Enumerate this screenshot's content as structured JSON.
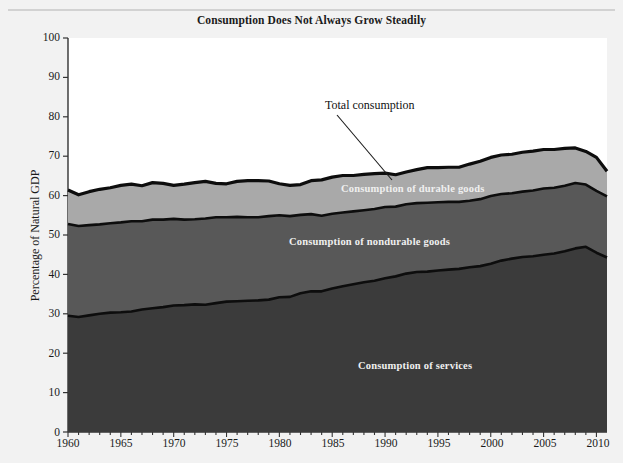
{
  "figure": {
    "title": "Consumption Does Not Always Grow Steadily",
    "caption": "",
    "background_color": "#f2f2f2",
    "plot_background_color": "#ffffff"
  },
  "annotations": {
    "total_consumption": "Total consumption",
    "durable_goods": "Consumption of durable goods",
    "nondurable_goods": "Consumption of nondurable goods",
    "services": "Consumption of services"
  },
  "axis": {
    "ylabel": "Percentage of Natural GDP",
    "yticks": [
      "100",
      "90",
      "80",
      "70",
      "60",
      "50",
      "40",
      "30",
      "20",
      "10",
      "0"
    ],
    "xticks": [
      "1960",
      "1965",
      "1970",
      "1975",
      "1980",
      "1985",
      "1990",
      "1995",
      "2000",
      "2005",
      "2010"
    ]
  },
  "chart_data": {
    "type": "area",
    "title": "Consumption Does Not Always Grow Steadily",
    "xlabel": "",
    "ylabel": "Percentage of Natural GDP",
    "xlim": [
      1960,
      2011
    ],
    "ylim": [
      0,
      100
    ],
    "grid": false,
    "legend": "in-plot labels",
    "stacked": true,
    "colors": {
      "services": "#3b3b3b",
      "nondurable_goods": "#585858",
      "durable_goods": "#a9a9a9",
      "outline": "#101010",
      "plot_background": "#ffffff"
    },
    "x": [
      1960,
      1961,
      1962,
      1963,
      1964,
      1965,
      1966,
      1967,
      1968,
      1969,
      1970,
      1971,
      1972,
      1973,
      1974,
      1975,
      1976,
      1977,
      1978,
      1979,
      1980,
      1981,
      1982,
      1983,
      1984,
      1985,
      1986,
      1987,
      1988,
      1989,
      1990,
      1991,
      1992,
      1993,
      1994,
      1995,
      1996,
      1997,
      1998,
      1999,
      2000,
      2001,
      2002,
      2003,
      2004,
      2005,
      2006,
      2007,
      2008,
      2009,
      2010,
      2011
    ],
    "series": [
      {
        "name": "Consumption of services",
        "values": [
          29.5,
          29.2,
          29.6,
          30.0,
          30.3,
          30.4,
          30.6,
          31.1,
          31.4,
          31.7,
          32.1,
          32.2,
          32.4,
          32.3,
          32.7,
          33.1,
          33.2,
          33.3,
          33.4,
          33.6,
          34.2,
          34.3,
          35.2,
          35.7,
          35.7,
          36.4,
          37.0,
          37.5,
          38.0,
          38.4,
          39.0,
          39.5,
          40.2,
          40.6,
          40.7,
          41.0,
          41.2,
          41.4,
          41.8,
          42.1,
          42.7,
          43.5,
          44.0,
          44.4,
          44.6,
          45.0,
          45.3,
          45.9,
          46.6,
          47.0,
          45.5,
          44.3
        ]
      },
      {
        "name": "Consumption of nondurable goods",
        "values": [
          23.3,
          23.1,
          22.9,
          22.7,
          22.7,
          22.8,
          22.9,
          22.4,
          22.5,
          22.2,
          22.0,
          21.7,
          21.6,
          21.9,
          21.8,
          21.4,
          21.4,
          21.2,
          21.1,
          21.2,
          20.8,
          20.5,
          19.9,
          19.6,
          19.2,
          19.0,
          18.7,
          18.5,
          18.3,
          18.2,
          18.1,
          17.7,
          17.6,
          17.5,
          17.5,
          17.3,
          17.2,
          17.0,
          16.9,
          17.0,
          17.2,
          16.9,
          16.6,
          16.6,
          16.7,
          16.8,
          16.7,
          16.6,
          16.6,
          15.8,
          15.7,
          15.5
        ]
      },
      {
        "name": "Consumption of durable goods",
        "values": [
          8.6,
          7.9,
          8.5,
          8.9,
          9.0,
          9.4,
          9.4,
          9.0,
          9.4,
          9.2,
          8.5,
          9.0,
          9.3,
          9.4,
          8.6,
          8.5,
          9.0,
          9.3,
          9.3,
          8.9,
          8.0,
          7.8,
          7.7,
          8.5,
          9.1,
          9.3,
          9.4,
          9.1,
          9.1,
          9.0,
          8.6,
          8.1,
          8.2,
          8.5,
          8.9,
          8.8,
          8.8,
          8.8,
          9.3,
          9.6,
          9.8,
          9.9,
          9.9,
          10.0,
          10.0,
          9.9,
          9.7,
          9.5,
          8.9,
          8.4,
          8.5,
          6.4
        ]
      }
    ],
    "total_consumption": {
      "name": "Total consumption",
      "values": [
        61.4,
        60.2,
        61.0,
        61.6,
        62.0,
        62.6,
        62.9,
        62.5,
        63.3,
        63.1,
        62.6,
        62.9,
        63.3,
        63.6,
        63.1,
        63.0,
        63.6,
        63.8,
        63.8,
        63.7,
        63.0,
        62.6,
        62.8,
        63.8,
        64.0,
        64.7,
        65.1,
        65.1,
        65.4,
        65.6,
        65.7,
        65.3,
        66.0,
        66.6,
        67.1,
        67.1,
        67.2,
        67.2,
        68.0,
        68.7,
        69.7,
        70.3,
        70.5,
        71.0,
        71.3,
        71.7,
        71.7,
        72.0,
        72.1,
        71.2,
        69.7,
        66.2
      ]
    }
  }
}
